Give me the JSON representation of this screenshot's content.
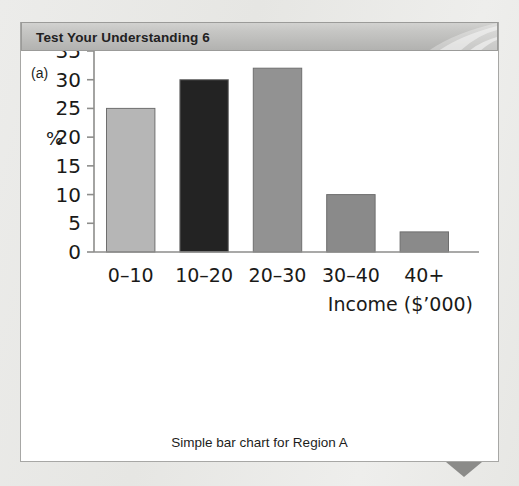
{
  "page": {
    "background_color": "#e9e9e7"
  },
  "header": {
    "title": "Test Your Understanding 6",
    "background_color": "#c2c2c0",
    "text_color": "#22211f"
  },
  "panel": {
    "sub_label": "(a)",
    "background_color": "#ffffff",
    "border_color": "#a7a7a5"
  },
  "caption": "Simple bar chart for Region A",
  "corner_marker": {
    "name": "down-triangle",
    "color": "#8b8b89"
  },
  "chart_data": {
    "type": "bar",
    "title": "",
    "subtitle": "",
    "categories": [
      "0–10",
      "10–20",
      "20–30",
      "30–40",
      "40+"
    ],
    "values": [
      25,
      30,
      32,
      10,
      3.5
    ],
    "bar_colors": [
      "#b6b6b6",
      "#232323",
      "#929292",
      "#8a8a8a",
      "#8a8a8a"
    ],
    "bar_border_color": "#6e6e6e",
    "xlabel": "Income ($’000)",
    "ylabel": "%",
    "ylim": [
      0,
      35
    ],
    "yticks": [
      0,
      5,
      10,
      15,
      20,
      25,
      30,
      35
    ],
    "ytick_labels": [
      "0",
      "5",
      "10",
      "15",
      "20",
      "25",
      "30",
      "35"
    ],
    "grid": false,
    "legend": "none",
    "axis_color": "#8d8d8b"
  }
}
